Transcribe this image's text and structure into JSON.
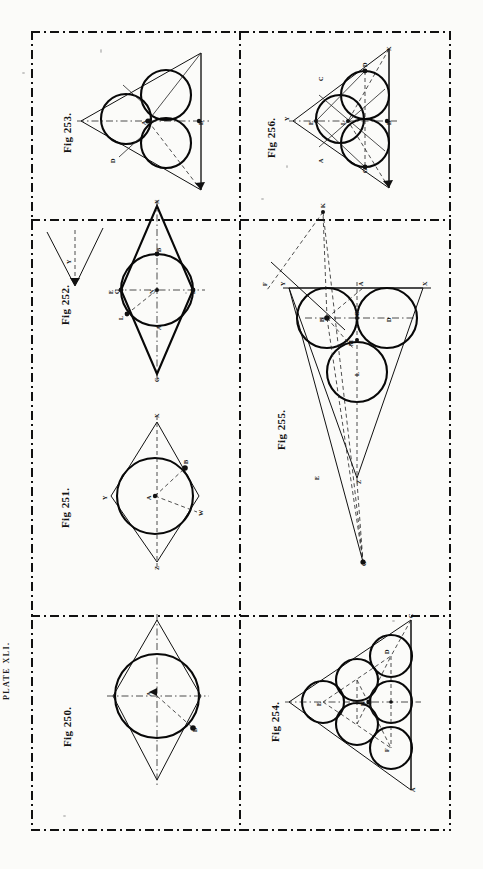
{
  "plate": {
    "label": "Plate XLI."
  },
  "document": {
    "title": "Plate XLI.",
    "kind": "geometry-plate",
    "rows": 3,
    "columns": 2,
    "frame_style": "dash-dot"
  },
  "figures": [
    {
      "id": "fig-253",
      "label": "Fig 253.",
      "caption": "Three equal circles inscribed in a triangle",
      "grid": {
        "row": 1,
        "column": 1
      },
      "circle_count": 3,
      "points": [
        "A",
        "B",
        "D"
      ]
    },
    {
      "id": "fig-256",
      "label": "Fig 256.",
      "caption": "Three equal circles inscribed in a triangle with construction lines",
      "grid": {
        "row": 1,
        "column": 2
      },
      "circle_count": 3,
      "points": [
        "X",
        "Y",
        "A",
        "B",
        "C",
        "D",
        "E",
        "F",
        "G"
      ]
    },
    {
      "id": "fig-252",
      "label": "Fig 252.",
      "caption": "Circle inscribed in a rhombus with angle construction",
      "grid": {
        "row": 2,
        "column": 1
      },
      "circle_count": 1,
      "points": [
        "X",
        "Y",
        "Z",
        "B",
        "C",
        "D",
        "E",
        "F",
        "L",
        "N"
      ]
    },
    {
      "id": "fig-255",
      "label": "Fig 255.",
      "caption": "Three equal circles inscribed in a narrow triangle",
      "grid": {
        "row": 2,
        "column": 2
      },
      "circle_count": 3,
      "points": [
        "X",
        "Y",
        "Z",
        "A",
        "B",
        "C",
        "D",
        "E",
        "F",
        "G",
        "K",
        "L",
        "M"
      ]
    },
    {
      "id": "fig-251",
      "label": "Fig 251.",
      "caption": "Circle inscribed in a quadrilateral",
      "grid": {
        "row": 3,
        "column": 1
      },
      "circle_count": 1,
      "points": [
        "X",
        "Y",
        "Z",
        "W",
        "A",
        "B"
      ]
    },
    {
      "id": "fig-250",
      "label": "Fig 250.",
      "caption": "Circle inscribed in a rhombus",
      "grid": {
        "row": 3,
        "column": 1,
        "note": "bottom-left cell"
      },
      "circle_count": 1,
      "points": [
        "A",
        "B"
      ]
    },
    {
      "id": "fig-254",
      "label": "Fig 254.",
      "caption": "Six equal circles inscribed in a triangle",
      "grid": {
        "row": 3,
        "column": 2
      },
      "circle_count": 6,
      "points": [
        "A",
        "B",
        "C",
        "D",
        "E",
        "F"
      ]
    }
  ],
  "colors": {
    "ink": "#111111",
    "paper": "#fbfbf9",
    "construction": "#222222"
  }
}
